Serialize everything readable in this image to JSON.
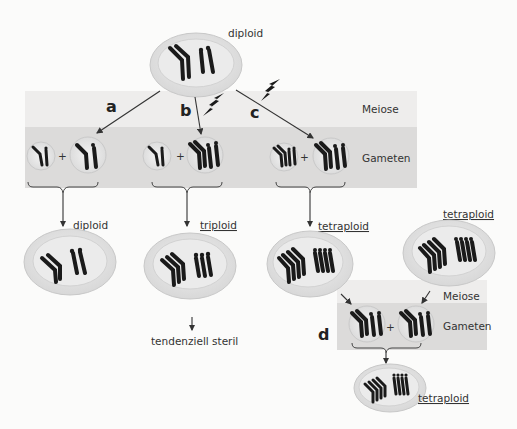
{
  "labels": {
    "top_cell": "diploid",
    "meiose": "Meiose",
    "gameten": "Gameten",
    "path_a": "a",
    "path_b": "b",
    "path_c": "c",
    "path_d": "d",
    "result_a": "diploid",
    "result_b": "triploid",
    "result_c": "tetraploid",
    "right_cell": "tetraploid",
    "sterile_note": "tendenziell steril",
    "result_d": "tetraploid"
  },
  "colors": {
    "background": "#fbfbfa",
    "meiose_band": "#eeedec",
    "gameten_band": "#dcdbda",
    "cell_fill": "#e4e4e4",
    "cell_inner": "#ececec",
    "chromosome": "#1a1a1a"
  }
}
